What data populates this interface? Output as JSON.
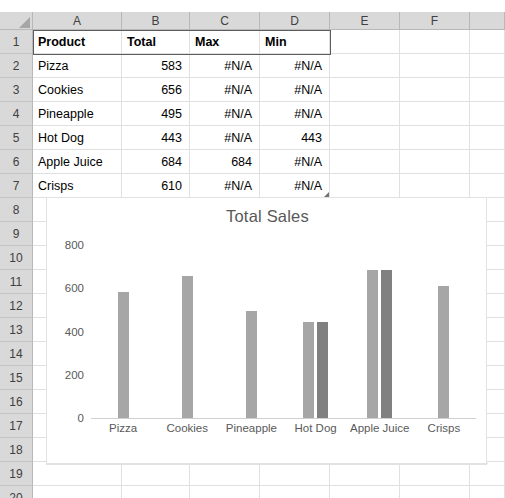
{
  "spreadsheet": {
    "column_headers": [
      "A",
      "B",
      "C",
      "D",
      "E",
      "F"
    ],
    "row_headers": [
      "1",
      "2",
      "3",
      "4",
      "5",
      "6",
      "7",
      "8",
      "9",
      "10",
      "11",
      "12",
      "13",
      "14",
      "15",
      "16",
      "17",
      "18",
      "19",
      "20"
    ],
    "header_row": {
      "a": "Product",
      "b": "Total",
      "c": "Max",
      "d": "Min"
    },
    "rows": [
      {
        "product": "Pizza",
        "total": "583",
        "max": "#N/A",
        "min": "#N/A"
      },
      {
        "product": "Cookies",
        "total": "656",
        "max": "#N/A",
        "min": "#N/A"
      },
      {
        "product": "Pineapple",
        "total": "495",
        "max": "#N/A",
        "min": "#N/A"
      },
      {
        "product": "Hot Dog",
        "total": "443",
        "max": "#N/A",
        "min": "443"
      },
      {
        "product": "Apple Juice",
        "total": "684",
        "max": "684",
        "min": "#N/A"
      },
      {
        "product": "Crisps",
        "total": "610",
        "max": "#N/A",
        "min": "#N/A"
      }
    ],
    "colors": {
      "header_fill": "#d9d9d9",
      "gridline": "#e0e0e0",
      "selection_border": "#5c5c5c"
    }
  },
  "chart_data": {
    "type": "bar",
    "title": "Total Sales",
    "xlabel": "",
    "ylabel": "",
    "categories": [
      "Pizza",
      "Cookies",
      "Pineapple",
      "Hot Dog",
      "Apple Juice",
      "Crisps"
    ],
    "series": [
      {
        "name": "Total",
        "color": "#a6a6a6",
        "values": [
          583,
          656,
          495,
          443,
          684,
          610
        ]
      },
      {
        "name": "Max",
        "color": "#808080",
        "values": [
          null,
          null,
          null,
          null,
          684,
          null
        ]
      },
      {
        "name": "Min",
        "color": "#808080",
        "values": [
          null,
          null,
          null,
          443,
          null,
          null
        ]
      }
    ],
    "ylim": [
      0,
      800
    ],
    "yticks": [
      0,
      200,
      400,
      600,
      800
    ],
    "grid": false,
    "legend": "none"
  }
}
